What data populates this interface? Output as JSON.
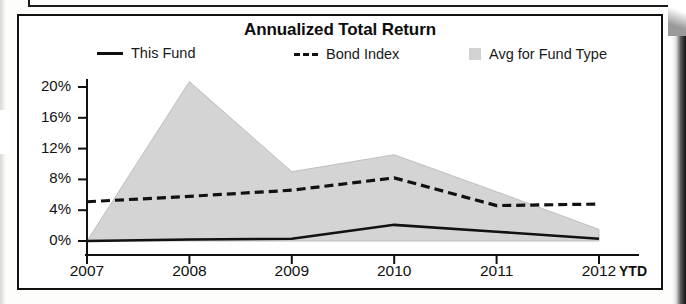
{
  "chart": {
    "title": "Annualized Total Return",
    "x_axis_suffix": "YTD"
  },
  "legend": {
    "items": [
      {
        "label": "This Fund",
        "marker": "solid-line",
        "color": "#111111"
      },
      {
        "label": "Bond Index",
        "marker": "dashed-line",
        "color": "#111111"
      },
      {
        "label": "Avg for Fund Type",
        "marker": "area-swatch",
        "color": "#d2d2d2"
      }
    ]
  },
  "chart_data": {
    "type": "line",
    "title": "Annualized Total Return",
    "xlabel": "",
    "ylabel": "",
    "x": [
      "2007",
      "2008",
      "2009",
      "2010",
      "2011",
      "2012"
    ],
    "categories": [
      "2007",
      "2008",
      "2009",
      "2010",
      "2011",
      "2012"
    ],
    "tick_labels": {
      "y": [
        "0%",
        "4%",
        "8%",
        "12%",
        "16%",
        "20%"
      ],
      "x": [
        "2007",
        "2008",
        "2009",
        "2010",
        "2011",
        "2012"
      ]
    },
    "ylim": [
      0,
      20
    ],
    "ytick_values": [
      0,
      4,
      8,
      12,
      16,
      20
    ],
    "grid": false,
    "legend_position": "top",
    "series": [
      {
        "name": "This Fund",
        "style": "solid",
        "color": "#111111",
        "values": [
          0.0,
          0.2,
          0.3,
          2.1,
          1.2,
          0.3
        ]
      },
      {
        "name": "Bond Index",
        "style": "dashed",
        "color": "#111111",
        "values": [
          5.1,
          5.8,
          6.6,
          8.2,
          4.6,
          4.8
        ]
      },
      {
        "name": "Avg for Fund Type",
        "style": "area",
        "color": "#d2d2d2",
        "upper_values": [
          0.0,
          20.7,
          9.0,
          11.2,
          6.4,
          1.5
        ],
        "lower_values": [
          0.0,
          0.0,
          0.0,
          0.0,
          0.0,
          0.0
        ]
      }
    ]
  },
  "y_ticks": [
    {
      "label": "20%",
      "value": 20
    },
    {
      "label": "16%",
      "value": 16
    },
    {
      "label": "12%",
      "value": 12
    },
    {
      "label": "8%",
      "value": 8
    },
    {
      "label": "4%",
      "value": 4
    },
    {
      "label": "0%",
      "value": 0
    }
  ],
  "x_ticks": [
    {
      "label": "2007"
    },
    {
      "label": "2008"
    },
    {
      "label": "2009"
    },
    {
      "label": "2010"
    },
    {
      "label": "2011"
    },
    {
      "label": "2012"
    }
  ]
}
